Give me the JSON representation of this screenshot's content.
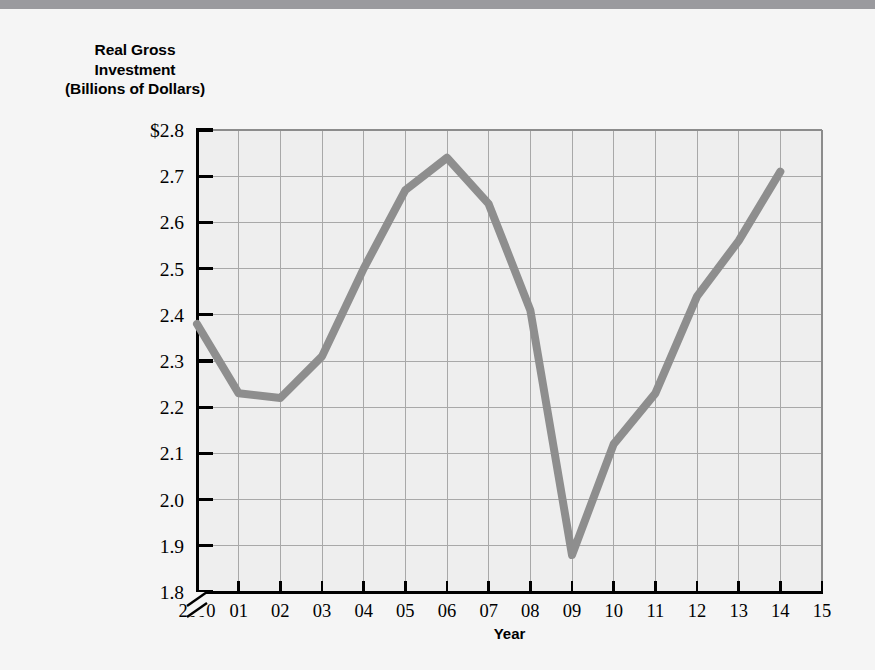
{
  "figure": {
    "background_color": "#f5f5f5",
    "top_bar_color": "#9a9a9e",
    "y_axis_title_lines": [
      "Real Gross",
      "Investment",
      "(Billions of Dollars)"
    ],
    "x_axis_title": "Year"
  },
  "chart_data": {
    "type": "line",
    "title": "",
    "xlabel": "Year",
    "ylabel": "Real Gross Investment (Billions of Dollars)",
    "x": [
      2000,
      2001,
      2002,
      2003,
      2004,
      2005,
      2006,
      2007,
      2008,
      2009,
      2010,
      2011,
      2012,
      2013,
      2014
    ],
    "values": [
      2.38,
      2.23,
      2.22,
      2.31,
      2.5,
      2.67,
      2.74,
      2.64,
      2.41,
      1.88,
      2.12,
      2.23,
      2.44,
      2.56,
      2.71
    ],
    "series": [
      {
        "name": "Real Gross Investment",
        "color": "#8e8e8e",
        "values": [
          2.38,
          2.23,
          2.22,
          2.31,
          2.5,
          2.67,
          2.74,
          2.64,
          2.41,
          1.88,
          2.12,
          2.23,
          2.44,
          2.56,
          2.71
        ]
      }
    ],
    "x_tick_labels": [
      "2000",
      "01",
      "02",
      "03",
      "04",
      "05",
      "06",
      "07",
      "08",
      "09",
      "10",
      "11",
      "12",
      "13",
      "14",
      "15"
    ],
    "x_tick_values": [
      2000,
      2001,
      2002,
      2003,
      2004,
      2005,
      2006,
      2007,
      2008,
      2009,
      2010,
      2011,
      2012,
      2013,
      2014,
      2015
    ],
    "y_tick_labels": [
      "$2.8",
      "2.7",
      "2.6",
      "2.5",
      "2.4",
      "2.3",
      "2.2",
      "2.1",
      "2.0",
      "1.9",
      "1.8"
    ],
    "y_tick_values": [
      2.8,
      2.7,
      2.6,
      2.5,
      2.4,
      2.3,
      2.2,
      2.1,
      2.0,
      1.9,
      1.8
    ],
    "xlim": [
      2000,
      2015
    ],
    "ylim": [
      1.8,
      2.8
    ],
    "grid": true,
    "grid_color": "#a8a8a8",
    "plot_background": "#eeeeee",
    "axis_break": true,
    "legend": "none"
  }
}
